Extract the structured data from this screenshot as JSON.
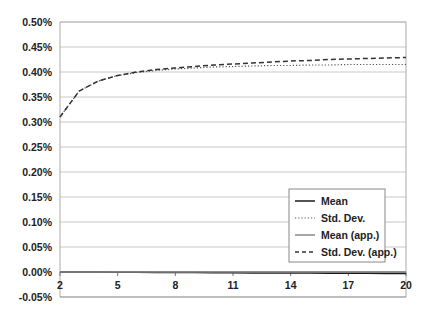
{
  "chart_data": {
    "type": "line",
    "title": "",
    "xlabel": "",
    "ylabel": "",
    "x": [
      2,
      3,
      4,
      5,
      6,
      7,
      8,
      9,
      10,
      11,
      12,
      13,
      14,
      15,
      16,
      17,
      18,
      19,
      20
    ],
    "xticks": [
      2,
      5,
      8,
      11,
      14,
      17,
      20
    ],
    "xlim": [
      2,
      20
    ],
    "yticks": [
      "0.50%",
      "0.45%",
      "0.40%",
      "0.35%",
      "0.30%",
      "0.25%",
      "0.20%",
      "0.15%",
      "0.10%",
      "0.05%",
      "0.00%",
      "-0.05%"
    ],
    "ylim": [
      -0.05,
      0.5
    ],
    "y_unit": "%",
    "grid": "horizontal",
    "legend_position": "lower right (inside)",
    "series": [
      {
        "name": "Mean",
        "style": "solid",
        "color": "#1a1a1a",
        "values": [
          0.0,
          0.0,
          -0.0002,
          -0.0004,
          -0.0006,
          -0.0008,
          -0.001,
          -0.0012,
          -0.0014,
          -0.0016,
          -0.0018,
          -0.002,
          -0.0021,
          -0.0022,
          -0.0024,
          -0.0025,
          -0.0026,
          -0.0028,
          -0.003
        ]
      },
      {
        "name": "Std. Dev.",
        "style": "dotted",
        "color": "#555555",
        "values": [
          0.31,
          0.362,
          0.382,
          0.393,
          0.399,
          0.403,
          0.406,
          0.408,
          0.41,
          0.411,
          0.412,
          0.413,
          0.413,
          0.414,
          0.414,
          0.415,
          0.415,
          0.415,
          0.415
        ]
      },
      {
        "name": "Mean (app.)",
        "style": "solid",
        "color": "#888888",
        "values": [
          0.0,
          0.0,
          0.0,
          0.0,
          0.0,
          0.0,
          0.0,
          0.0,
          0.0,
          0.0,
          0.0,
          0.0,
          0.0,
          0.0,
          0.0,
          0.0,
          0.0,
          0.0,
          0.0
        ]
      },
      {
        "name": "Std. Dev. (app.)",
        "style": "dashed",
        "color": "#333333",
        "values": [
          0.31,
          0.362,
          0.382,
          0.393,
          0.4,
          0.405,
          0.408,
          0.411,
          0.414,
          0.416,
          0.418,
          0.42,
          0.422,
          0.423,
          0.425,
          0.426,
          0.427,
          0.428,
          0.429
        ]
      }
    ]
  }
}
